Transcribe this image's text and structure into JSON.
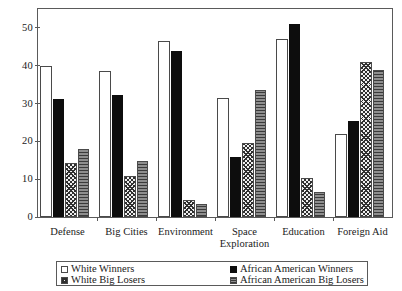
{
  "chart_data": {
    "type": "bar",
    "title": "",
    "xlabel": "",
    "ylabel": "",
    "ylim": [
      0,
      55
    ],
    "yticks": [
      0,
      10,
      20,
      30,
      40,
      50
    ],
    "ytick_labels": [
      "0",
      "10",
      "20",
      "30",
      "40",
      "50"
    ],
    "grid": false,
    "legend_position": "bottom",
    "categories": [
      "Defense",
      "Big Cities",
      "Environment",
      "Space Exploration",
      "Education",
      "Foreign Aid"
    ],
    "category_labels": [
      {
        "line1": "Defense",
        "line2": ""
      },
      {
        "line1": "Big Cities",
        "line2": ""
      },
      {
        "line1": "Environment",
        "line2": ""
      },
      {
        "line1": "Space",
        "line2": "Exploration"
      },
      {
        "line1": "Education",
        "line2": ""
      },
      {
        "line1": "Foreign Aid",
        "line2": ""
      }
    ],
    "series": [
      {
        "name": "White Winners",
        "swatch": "open-white",
        "color": "#ffffff",
        "values": [
          40.0,
          38.5,
          46.5,
          31.5,
          47.0,
          22.0
        ]
      },
      {
        "name": "African American Winners",
        "swatch": "solid-black",
        "color": "#0d0d0d",
        "values": [
          31.3,
          32.3,
          44.0,
          16.0,
          51.0,
          25.5
        ]
      },
      {
        "name": "White Big Losers",
        "swatch": "crosshatch",
        "color": "#efefef",
        "values": [
          14.2,
          10.8,
          4.5,
          19.5,
          10.2,
          41.0
        ]
      },
      {
        "name": "African American Big Losers",
        "swatch": "horizontal-hatch",
        "color": "#8e8e8e",
        "values": [
          18.0,
          14.8,
          3.5,
          33.5,
          6.7,
          39.0
        ]
      }
    ]
  },
  "legend": {
    "items": [
      {
        "label": "White Winners",
        "series": 0
      },
      {
        "label": "White Big Losers",
        "series": 2
      },
      {
        "label": "African American Winners",
        "series": 1
      },
      {
        "label": "African American Big Losers",
        "series": 3
      }
    ]
  }
}
